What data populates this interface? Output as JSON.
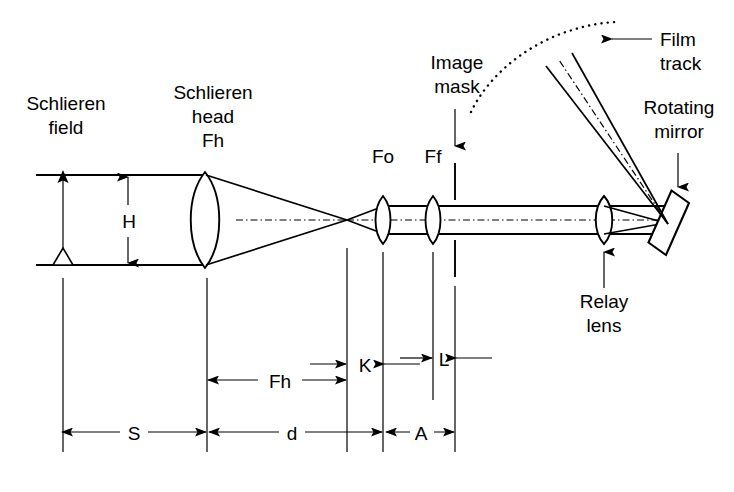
{
  "figure": {
    "background_color": "#ffffff",
    "line_color": "#000000"
  },
  "labels": {
    "schlieren_field_line1": "Schlieren",
    "schlieren_field_line2": "field",
    "schlieren_head_line1": "Schlieren",
    "schlieren_head_line2": "head",
    "schlieren_head_line3": "Fh",
    "image_mask_line1": "Image",
    "image_mask_line2": "mask",
    "film_track_line1": "Film",
    "film_track_line2": "track",
    "rotating_mirror_line1": "Rotating",
    "rotating_mirror_line2": "mirror",
    "relay_lens_line1": "Relay",
    "relay_lens_line2": "lens",
    "lens_fo": "Fo",
    "lens_ff": "Ff"
  },
  "dimensions": {
    "height_h": "H",
    "focal_fh": "Fh",
    "distance_k": "K",
    "distance_l": "L",
    "distance_s": "S",
    "distance_d": "d",
    "distance_a": "A"
  },
  "components": [
    {
      "name": "schlieren-head-lens",
      "type": "biconvex-lens",
      "x": 205,
      "label": "Fh"
    },
    {
      "name": "objective-lens-fo",
      "type": "biconvex-lens",
      "x": 383,
      "label": "Fo"
    },
    {
      "name": "field-lens-ff",
      "type": "biconvex-lens",
      "x": 433,
      "label": "Ff"
    },
    {
      "name": "image-mask",
      "type": "mask-plane",
      "x": 455,
      "label": "Image mask"
    },
    {
      "name": "relay-lens",
      "type": "biconvex-lens",
      "x": 604,
      "label": "Relay lens"
    },
    {
      "name": "rotating-mirror",
      "type": "tilted-mirror",
      "x": 668,
      "label": "Rotating mirror"
    },
    {
      "name": "film-track",
      "type": "dotted-arc",
      "label": "Film track"
    }
  ]
}
